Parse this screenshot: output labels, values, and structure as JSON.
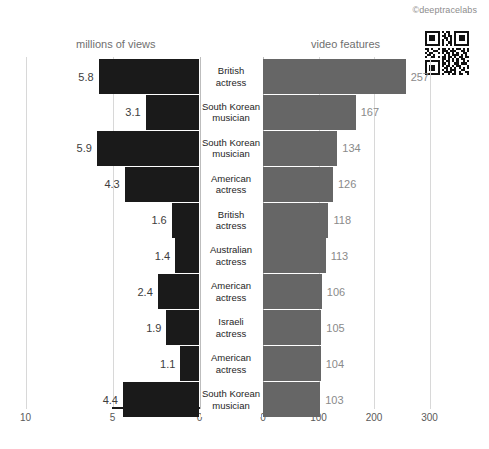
{
  "watermark": "©deeptracelabs",
  "icons": {
    "qr": "qr-code-icon"
  },
  "chart_data": {
    "type": "bar",
    "subtype": "diverging-paired-bar",
    "title": "",
    "left_panel": {
      "label": "millions of views",
      "xlabel": "millions of views",
      "ticks": [
        "10",
        "5",
        "0"
      ],
      "tick_values": [
        10,
        5,
        0
      ],
      "xlim": [
        10,
        0
      ],
      "direction": "right-to-left",
      "color": "#1a1a1a",
      "grid": true
    },
    "right_panel": {
      "label": "video features",
      "xlabel": "video features",
      "ticks": [
        "0",
        "100",
        "200",
        "300"
      ],
      "tick_values": [
        0,
        100,
        200,
        300
      ],
      "xlim": [
        0,
        300
      ],
      "direction": "left-to-right",
      "color": "#666666",
      "grid": true
    },
    "categories": [
      "British actress",
      "South Korean musician",
      "South Korean musician",
      "American actress",
      "British actress",
      "Australian actress",
      "American actress",
      "Israeli actress",
      "American actress",
      "South Korean musician"
    ],
    "series": [
      {
        "name": "millions of views",
        "values": [
          5.8,
          3.1,
          5.9,
          4.3,
          1.6,
          1.4,
          2.4,
          1.9,
          1.1,
          4.4
        ],
        "labels": [
          "5.8",
          "3.1",
          "5.9",
          "4.3",
          "1.6",
          "1.4",
          "2.4",
          "1.9",
          "1.1",
          "4.4"
        ]
      },
      {
        "name": "video features",
        "values": [
          257,
          167,
          134,
          126,
          118,
          113,
          106,
          105,
          104,
          103
        ],
        "labels": [
          "257",
          "167",
          "134",
          "126",
          "118",
          "113",
          "106",
          "105",
          "104",
          "103"
        ]
      }
    ],
    "rows": [
      {
        "category_line1": "British",
        "category_line2": "actress",
        "views": "5.8",
        "features": "257"
      },
      {
        "category_line1": "South Korean",
        "category_line2": "musician",
        "views": "3.1",
        "features": "167"
      },
      {
        "category_line1": "South Korean",
        "category_line2": "musician",
        "views": "5.9",
        "features": "134"
      },
      {
        "category_line1": "American",
        "category_line2": "actress",
        "views": "4.3",
        "features": "126"
      },
      {
        "category_line1": "British",
        "category_line2": "actress",
        "views": "1.6",
        "features": "118"
      },
      {
        "category_line1": "Australian",
        "category_line2": "actress",
        "views": "1.4",
        "features": "113"
      },
      {
        "category_line1": "American",
        "category_line2": "actress",
        "views": "2.4",
        "features": "106"
      },
      {
        "category_line1": "Israeli",
        "category_line2": "actress",
        "views": "1.9",
        "features": "105"
      },
      {
        "category_line1": "American",
        "category_line2": "actress",
        "views": "1.1",
        "features": "104"
      },
      {
        "category_line1": "South Korean",
        "category_line2": "musician",
        "views": "4.4",
        "features": "103"
      }
    ]
  }
}
